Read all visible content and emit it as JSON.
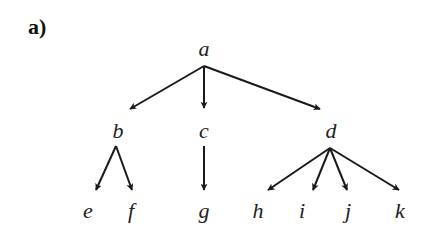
{
  "panel_label": "a)",
  "tree": {
    "nodes": [
      {
        "id": "a",
        "label": "a",
        "x": 204,
        "y": 56
      },
      {
        "id": "b",
        "label": "b",
        "x": 118,
        "y": 138
      },
      {
        "id": "c",
        "label": "c",
        "x": 204,
        "y": 138
      },
      {
        "id": "d",
        "label": "d",
        "x": 331,
        "y": 138
      },
      {
        "id": "e",
        "label": "e",
        "x": 88,
        "y": 218
      },
      {
        "id": "f",
        "label": "f",
        "x": 131,
        "y": 218
      },
      {
        "id": "g",
        "label": "g",
        "x": 204,
        "y": 218
      },
      {
        "id": "h",
        "label": "h",
        "x": 258,
        "y": 218
      },
      {
        "id": "i",
        "label": "i",
        "x": 302,
        "y": 218
      },
      {
        "id": "j",
        "label": "j",
        "x": 348,
        "y": 218
      },
      {
        "id": "k",
        "label": "k",
        "x": 400,
        "y": 218
      }
    ],
    "edges": [
      {
        "from": "a",
        "to": "b",
        "x1": 204,
        "y1": 66,
        "x2": 130,
        "y2": 109
      },
      {
        "from": "a",
        "to": "c",
        "x1": 204,
        "y1": 66,
        "x2": 204,
        "y2": 108
      },
      {
        "from": "a",
        "to": "d",
        "x1": 204,
        "y1": 66,
        "x2": 320,
        "y2": 109
      },
      {
        "from": "b",
        "to": "e",
        "x1": 116,
        "y1": 146,
        "x2": 96,
        "y2": 190
      },
      {
        "from": "b",
        "to": "f",
        "x1": 116,
        "y1": 146,
        "x2": 132,
        "y2": 190
      },
      {
        "from": "c",
        "to": "g",
        "x1": 204,
        "y1": 146,
        "x2": 204,
        "y2": 190
      },
      {
        "from": "d",
        "to": "h",
        "x1": 330,
        "y1": 148,
        "x2": 268,
        "y2": 190
      },
      {
        "from": "d",
        "to": "i",
        "x1": 330,
        "y1": 148,
        "x2": 313,
        "y2": 190
      },
      {
        "from": "d",
        "to": "j",
        "x1": 330,
        "y1": 148,
        "x2": 347,
        "y2": 190
      },
      {
        "from": "d",
        "to": "k",
        "x1": 330,
        "y1": 148,
        "x2": 399,
        "y2": 190
      }
    ]
  }
}
